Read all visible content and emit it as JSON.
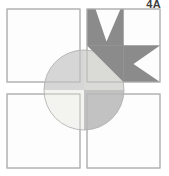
{
  "figure": {
    "label": "4A"
  },
  "colors": {
    "background": "#ffffff",
    "square_fill": "#fdfdfd",
    "square_border": "#b2b2b2",
    "circle_top_left": "#d6d6d6",
    "circle_top_right": "#dadad6",
    "circle_bottom_left": "#f3f3f0",
    "circle_bottom_right": "#c2c2c2",
    "circle_outline": "#ababab",
    "star_dark": "#8b8b8b",
    "seam_line": "rgba(0,0,0,0.18)",
    "label_color": "#3c3c3c"
  }
}
